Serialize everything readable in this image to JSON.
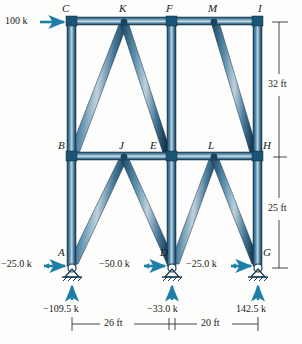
{
  "figure": {
    "type": "truss-free-body-diagram",
    "units": "kips / feet",
    "member_color": "#2e6b8e",
    "member_edge_color": "#12364d",
    "member_highlight_color": "#b9ccd8",
    "arrow_color": "#1b7fa8",
    "text_color": "#1a1a1a"
  },
  "nodes": [
    {
      "id": "C",
      "label": "C",
      "x": 72,
      "y": 20,
      "label_x": 62,
      "label_y": 3
    },
    {
      "id": "K",
      "label": "K",
      "x": 124,
      "y": 20,
      "label_x": 119,
      "label_y": 3
    },
    {
      "id": "F",
      "label": "F",
      "x": 172,
      "y": 20,
      "label_x": 166,
      "label_y": 3
    },
    {
      "id": "M",
      "label": "M",
      "x": 214,
      "y": 20,
      "label_x": 208,
      "label_y": 3
    },
    {
      "id": "I",
      "label": "I",
      "x": 258,
      "y": 20,
      "label_x": 258,
      "label_y": 3
    },
    {
      "id": "B",
      "label": "B",
      "x": 72,
      "y": 155,
      "label_x": 58,
      "label_y": 140
    },
    {
      "id": "J",
      "label": "J",
      "x": 124,
      "y": 155,
      "label_x": 119,
      "label_y": 140
    },
    {
      "id": "E",
      "label": "E",
      "x": 168,
      "y": 155,
      "label_x": 150,
      "label_y": 140
    },
    {
      "id": "L",
      "label": "L",
      "x": 214,
      "y": 155,
      "label_x": 208,
      "label_y": 140
    },
    {
      "id": "H",
      "label": "H",
      "x": 258,
      "y": 155,
      "label_x": 262,
      "label_y": 140
    },
    {
      "id": "A",
      "label": "A",
      "x": 72,
      "y": 265,
      "label_x": 58,
      "label_y": 248
    },
    {
      "id": "D",
      "label": "D",
      "x": 172,
      "y": 265,
      "label_x": 160,
      "label_y": 248
    },
    {
      "id": "G",
      "label": "G",
      "x": 258,
      "y": 265,
      "label_x": 262,
      "label_y": 248
    }
  ],
  "loads": {
    "applied": [
      {
        "name": "horizontal-load-at-C",
        "text": "100 k",
        "label_x": 6,
        "label_y": 17,
        "direction": "right"
      }
    ]
  },
  "reactions": {
    "horizontal": [
      {
        "name": "reaction-h-A",
        "text": "−25.0 k",
        "label_x": 2,
        "label_y": 258,
        "node": "A"
      },
      {
        "name": "reaction-h-D",
        "text": "−50.0 k",
        "label_x": 100,
        "label_y": 258,
        "node": "D"
      },
      {
        "name": "reaction-h-G",
        "text": "−25.0 k",
        "label_x": 189,
        "label_y": 258,
        "node": "G"
      }
    ],
    "vertical": [
      {
        "name": "reaction-v-A",
        "text": "−109.5 k",
        "label_x": 44,
        "label_y": 303,
        "node": "A"
      },
      {
        "name": "reaction-v-D",
        "text": "−33.0 k",
        "label_x": 148,
        "label_y": 303,
        "node": "D"
      },
      {
        "name": "reaction-v-G",
        "text": "142.5 k",
        "label_x": 237,
        "label_y": 303,
        "node": "G"
      }
    ]
  },
  "dimensions": {
    "vertical": [
      {
        "name": "dim-upper-height",
        "text": "32 ft",
        "label_x": 272,
        "label_y": 83
      },
      {
        "name": "dim-lower-height",
        "text": "25 ft",
        "label_x": 272,
        "label_y": 208
      }
    ],
    "horizontal": [
      {
        "name": "dim-left-span",
        "text": "26 ft",
        "label_x": 106,
        "label_y": 322
      },
      {
        "name": "dim-right-span",
        "text": "20 ft",
        "label_x": 203,
        "label_y": 322
      }
    ]
  },
  "members": {
    "chords_top": [
      "C-K",
      "K-F",
      "F-M",
      "M-I"
    ],
    "chords_middle": [
      "B-J",
      "J-E",
      "L-H"
    ],
    "columns": [
      "C-B",
      "B-A",
      "F-E",
      "F-D",
      "I-H",
      "H-G"
    ],
    "diagonals": [
      "B-K",
      "K-E",
      "A-J",
      "J-D",
      "F-M",
      "M-H",
      "D-L",
      "L-G"
    ]
  }
}
